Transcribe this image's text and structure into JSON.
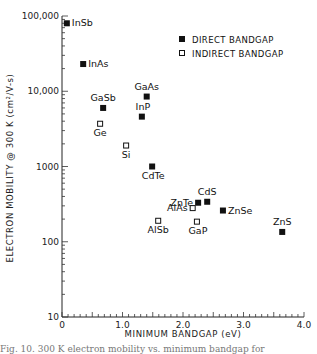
{
  "chart_data": {
    "type": "scatter",
    "title": "",
    "xlabel": "MINIMUM BANDGAP (eV)",
    "ylabel": "ELECTRON MOBILITY @ 300 K (cm²/V-s)",
    "xlim": [
      0,
      4.0
    ],
    "ylim": [
      10,
      100000
    ],
    "yscale": "log",
    "grid": false,
    "legend_position": "upper right",
    "x_ticks": [
      "0",
      "1.0",
      "2.0",
      "3.0",
      "4.0"
    ],
    "y_ticks": [
      "10",
      "100",
      "1000",
      "10,000",
      "100,000"
    ],
    "legend": [
      {
        "label": "DIRECT BANDGAP",
        "marker": "filled-square"
      },
      {
        "label": "INDIRECT BANDGAP",
        "marker": "open-square"
      }
    ],
    "series": [
      {
        "name": "DIRECT BANDGAP",
        "marker": "filled-square",
        "points": [
          {
            "label": "InSb",
            "x": 0.08,
            "y": 80000
          },
          {
            "label": "InAs",
            "x": 0.35,
            "y": 23000
          },
          {
            "label": "GaSb",
            "x": 0.68,
            "y": 6000
          },
          {
            "label": "GaAs",
            "x": 1.4,
            "y": 8500
          },
          {
            "label": "InP",
            "x": 1.32,
            "y": 4600
          },
          {
            "label": "CdTe",
            "x": 1.49,
            "y": 1000
          },
          {
            "label": "ZnTe",
            "x": 2.25,
            "y": 330
          },
          {
            "label": "CdS",
            "x": 2.4,
            "y": 340
          },
          {
            "label": "ZnSe",
            "x": 2.66,
            "y": 260
          },
          {
            "label": "ZnS",
            "x": 3.64,
            "y": 135
          }
        ]
      },
      {
        "name": "INDIRECT BANDGAP",
        "marker": "open-square",
        "points": [
          {
            "label": "Ge",
            "x": 0.63,
            "y": 3700
          },
          {
            "label": "Si",
            "x": 1.06,
            "y": 1900
          },
          {
            "label": "AlAs",
            "x": 2.16,
            "y": 280
          },
          {
            "label": "AlSb",
            "x": 1.59,
            "y": 190
          },
          {
            "label": "GaP",
            "x": 2.23,
            "y": 185
          }
        ]
      }
    ]
  },
  "axes": {
    "xlabel": "MINIMUM BANDGAP (eV)",
    "ylabel": "ELECTRON MOBILITY @ 300 K (cm²/V-s)",
    "x_ticks": [
      "0",
      "1.0",
      "2.0",
      "3.0",
      "4.0"
    ],
    "y_ticks": [
      "10",
      "100",
      "1000",
      "10,000",
      "100,000"
    ]
  },
  "legend": {
    "direct": "DIRECT BANDGAP",
    "indirect": "INDIRECT BANDGAP"
  },
  "caption": "Fig. 10. 300 K electron mobility vs. minimum bandgap for"
}
